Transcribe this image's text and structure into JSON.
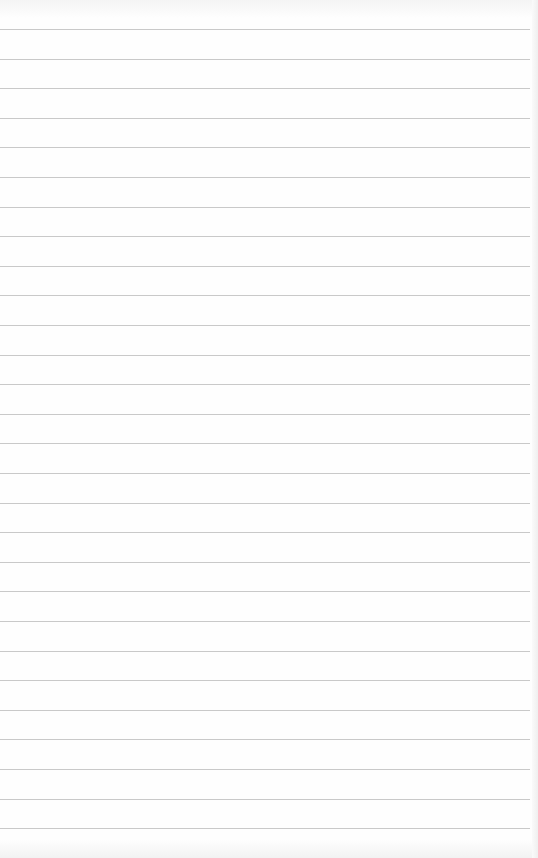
{
  "paper": {
    "type": "lined-paper",
    "background": "#fefefe",
    "line_color": "#c9c9c9",
    "first_line_y": 29,
    "line_spacing": 29.6,
    "line_count": 28
  }
}
